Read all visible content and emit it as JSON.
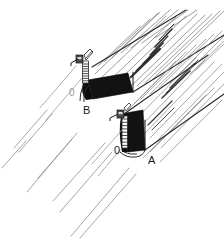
{
  "figure": {
    "background_color": "#ffffff",
    "ink_color": "#1a1a1a",
    "grain_color": "#8a8a8a",
    "endgrain_fill": "#111111",
    "width": 224,
    "height": 239
  },
  "labels": {
    "piece_a": "A",
    "piece_b": "B",
    "zero_mark_a": "0",
    "zero_mark_b": "0"
  },
  "parts": {
    "board_a_name": "board-a",
    "board_b_name": "board-b",
    "endgrain_a_name": "end-grain-face-a",
    "endgrain_b_name": "end-grain-face-b",
    "gauge_a_name": "marking-gauge-a",
    "gauge_b_name": "marking-gauge-b",
    "scale_a_name": "tick-scale-a",
    "scale_b_name": "tick-scale-b"
  },
  "scales": {
    "tick_count_a": 9,
    "tick_count_b": 8
  },
  "grain": {
    "angle_degrees": 52,
    "line_count_lower_left": 9,
    "line_count_board_b": 16,
    "line_count_board_a": 18
  }
}
